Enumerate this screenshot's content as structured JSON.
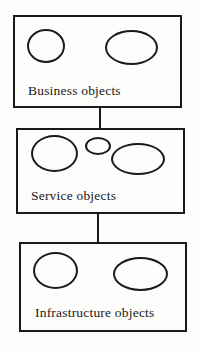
{
  "diagram": {
    "type": "layered-architecture",
    "colors": {
      "stroke": "#1a1a1a",
      "background": "#fdfdfc"
    },
    "layers": [
      {
        "id": "business",
        "label": "Business objects",
        "object_ellipse_count": 2
      },
      {
        "id": "service",
        "label": "Service objects",
        "object_ellipse_count": 3
      },
      {
        "id": "infrastructure",
        "label": "Infrastructure objects",
        "object_ellipse_count": 2
      }
    ],
    "connectors": [
      {
        "from": "business",
        "to": "service"
      },
      {
        "from": "service",
        "to": "infrastructure"
      }
    ]
  }
}
